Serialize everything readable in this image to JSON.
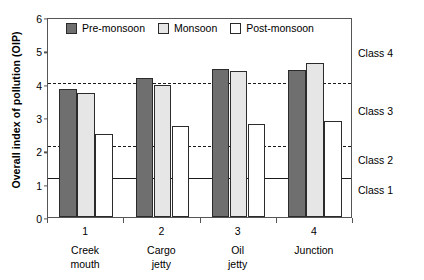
{
  "chart_data": {
    "type": "bar",
    "title": "",
    "xlabel": "",
    "ylabel": "Overall index of pollution (OIP)",
    "ylim": [
      0,
      6
    ],
    "yticks": [
      0,
      1,
      2,
      3,
      4,
      5,
      6
    ],
    "grid": false,
    "legend_position": "top-left-inside",
    "categories": [
      "1",
      "2",
      "3",
      "4"
    ],
    "category_names": [
      "Creek mouth",
      "Cargo jetty",
      "Oil jetty",
      "Junction"
    ],
    "category_name_lines": [
      [
        "Creek",
        "mouth"
      ],
      [
        "Cargo",
        "jetty"
      ],
      [
        "Oil",
        "jetty"
      ],
      [
        "Junction",
        ""
      ]
    ],
    "series": [
      {
        "name": "Pre-monsoon",
        "color": "#6f6f6f",
        "values": [
          3.85,
          4.16,
          4.45,
          4.4
        ]
      },
      {
        "name": "Monsoon",
        "color": "#e6e6e6",
        "values": [
          3.73,
          3.95,
          4.38,
          4.62
        ]
      },
      {
        "name": "Post-monsoon",
        "color": "#ffffff",
        "values": [
          2.49,
          2.72,
          2.8,
          2.88
        ]
      }
    ],
    "reference_lines": [
      {
        "value": 4.08,
        "style": "dashed",
        "label": ""
      },
      {
        "value": 2.2,
        "style": "dashed",
        "label": ""
      },
      {
        "value": 1.24,
        "style": "solid",
        "label": ""
      }
    ],
    "class_labels": [
      {
        "label": "Class 4",
        "value": 4.95
      },
      {
        "label": "Class 3",
        "value": 3.2
      },
      {
        "label": "Class 2",
        "value": 1.75
      },
      {
        "label": "Class 1",
        "value": 0.85
      }
    ]
  },
  "axis": {
    "ytick_labels": [
      "0",
      "1",
      "2",
      "3",
      "4",
      "5",
      "6"
    ]
  },
  "legend": {
    "items": [
      {
        "label": "Pre-monsoon"
      },
      {
        "label": "Monsoon"
      },
      {
        "label": "Post-monsoon"
      }
    ]
  }
}
